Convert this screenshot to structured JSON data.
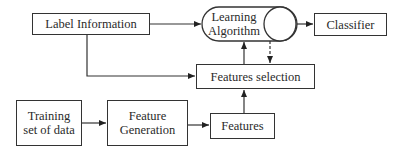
{
  "diagram": {
    "type": "flowchart",
    "nodes": {
      "label_information": {
        "label": "Label Information",
        "shape": "rectangle"
      },
      "learning_algorithm": {
        "label_line1": "Learning",
        "label_line2": "Algorithm",
        "shape": "cylinder"
      },
      "classifier": {
        "label": "Classifier",
        "shape": "rectangle"
      },
      "features_selection": {
        "label": "Features selection",
        "shape": "rectangle"
      },
      "training_set": {
        "label_line1": "Training",
        "label_line2": "set of data",
        "shape": "rectangle"
      },
      "feature_generation": {
        "label_line1": "Feature",
        "label_line2": "Generation",
        "shape": "rectangle"
      },
      "features": {
        "label": "Features",
        "shape": "rectangle"
      }
    },
    "edges": [
      {
        "from": "Label Information",
        "to": "Learning Algorithm",
        "style": "solid"
      },
      {
        "from": "Label Information",
        "to": "Features selection",
        "style": "solid"
      },
      {
        "from": "Learning Algorithm",
        "to": "Classifier",
        "style": "solid"
      },
      {
        "from": "Features selection",
        "to": "Learning Algorithm",
        "style": "solid"
      },
      {
        "from": "Learning Algorithm",
        "to": "Features selection",
        "style": "dashed"
      },
      {
        "from": "Training set of data",
        "to": "Feature Generation",
        "style": "solid"
      },
      {
        "from": "Feature Generation",
        "to": "Features",
        "style": "solid"
      },
      {
        "from": "Features",
        "to": "Features selection",
        "style": "solid"
      }
    ],
    "colors": {
      "stroke": "#333333",
      "background": "#ffffff",
      "text": "#2a2a2a"
    }
  }
}
